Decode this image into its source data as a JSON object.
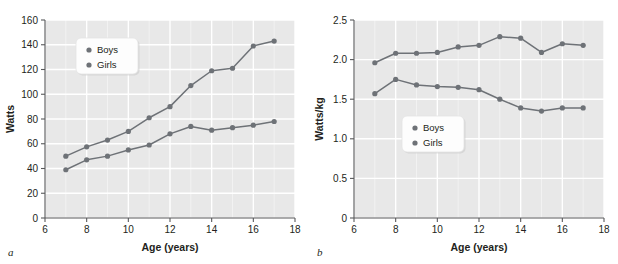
{
  "figure": {
    "background": "#ffffff",
    "series_color": "#6e7277",
    "plot_background": "#e8e8e8",
    "gridline_color": "#ffffff",
    "axis_color": "#58595b"
  },
  "panels": [
    {
      "letter": "a",
      "legend": {
        "position": "top-left-inside",
        "items": [
          "Boys",
          "Girls"
        ]
      },
      "chart_data": {
        "type": "line",
        "title": "",
        "xlabel": "Age (years)",
        "ylabel": "Watts",
        "xlim": [
          6,
          18
        ],
        "ylim": [
          0,
          160
        ],
        "xticks": [
          6,
          8,
          10,
          12,
          14,
          16,
          18
        ],
        "yticks": [
          0,
          20,
          40,
          60,
          80,
          100,
          120,
          140,
          160
        ],
        "xtick_labels": [
          "6",
          "8",
          "10",
          "12",
          "14",
          "16",
          "18"
        ],
        "ytick_labels": [
          "0",
          "20",
          "40",
          "60",
          "80",
          "100",
          "120",
          "140",
          "160"
        ],
        "grid": true,
        "x": [
          7,
          8,
          9,
          10,
          11,
          12,
          13,
          14,
          15,
          16,
          17
        ],
        "series": [
          {
            "name": "Boys",
            "values": [
              50,
              57.5,
              63,
              70,
              81,
              90,
              107,
              119,
              121,
              139,
              143
            ]
          },
          {
            "name": "Girls",
            "values": [
              39,
              47,
              50,
              55,
              59,
              68,
              74,
              71,
              73,
              75,
              78
            ]
          }
        ]
      }
    },
    {
      "letter": "b",
      "legend": {
        "position": "lower-left-inside",
        "items": [
          "Boys",
          "Girls"
        ]
      },
      "chart_data": {
        "type": "line",
        "title": "",
        "xlabel": "Age (years)",
        "ylabel": "Watts/kg",
        "xlim": [
          6,
          18
        ],
        "ylim": [
          0,
          2.5
        ],
        "xticks": [
          6,
          8,
          10,
          12,
          14,
          16,
          18
        ],
        "yticks": [
          0,
          0.5,
          1.0,
          1.5,
          2.0,
          2.5
        ],
        "xtick_labels": [
          "6",
          "8",
          "10",
          "12",
          "14",
          "16",
          "18"
        ],
        "ytick_labels": [
          "0",
          "0.5",
          "1.0",
          "1.5",
          "2.0",
          "2.5"
        ],
        "grid": true,
        "x": [
          7,
          8,
          9,
          10,
          11,
          12,
          13,
          14,
          15,
          16,
          17
        ],
        "series": [
          {
            "name": "Boys",
            "values": [
              1.96,
              2.08,
              2.08,
              2.09,
              2.16,
              2.18,
              2.29,
              2.27,
              2.09,
              2.2,
              2.18
            ]
          },
          {
            "name": "Girls",
            "values": [
              1.57,
              1.75,
              1.68,
              1.66,
              1.65,
              1.62,
              1.5,
              1.39,
              1.35,
              1.39,
              1.39
            ]
          }
        ]
      }
    }
  ]
}
